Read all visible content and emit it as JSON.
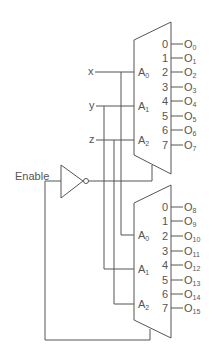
{
  "diagram": {
    "type": "3-to-8 decoders combined into 4-to-16 decoder",
    "inputs": {
      "x": "x",
      "y": "y",
      "z": "z",
      "enable": "Enable"
    },
    "top_decoder": {
      "address_labels": [
        "A",
        "A",
        "A"
      ],
      "address_subs": [
        "0",
        "1",
        "2"
      ],
      "pin_numbers": [
        "0",
        "1",
        "2",
        "3",
        "4",
        "5",
        "6",
        "7"
      ],
      "output_base": "O",
      "output_subs": [
        "0",
        "1",
        "2",
        "3",
        "4",
        "5",
        "6",
        "7"
      ]
    },
    "bottom_decoder": {
      "address_labels": [
        "A",
        "A",
        "A"
      ],
      "address_subs": [
        "0",
        "1",
        "2"
      ],
      "pin_numbers": [
        "0",
        "1",
        "2",
        "3",
        "4",
        "5",
        "6",
        "7"
      ],
      "output_base": "O",
      "output_subs": [
        "8",
        "9",
        "10",
        "11",
        "12",
        "13",
        "14",
        "15"
      ]
    },
    "colors": {
      "line": "#555555",
      "background": "#ffffff"
    }
  }
}
